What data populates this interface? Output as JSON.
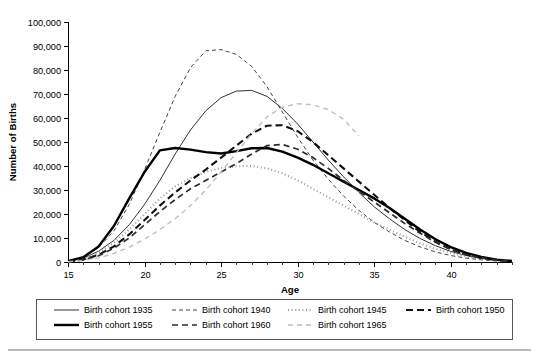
{
  "chart_data": {
    "type": "line",
    "title": "",
    "xlabel": "Age",
    "ylabel": "Number of Births",
    "xlim": [
      15,
      44
    ],
    "ylim": [
      0,
      100000
    ],
    "ytick_labels": [
      "0",
      "10,000",
      "20,000",
      "30,000",
      "40,000",
      "50,000",
      "60,000",
      "70,000",
      "80,000",
      "90,000",
      "100,000"
    ],
    "ytick_values": [
      0,
      10000,
      20000,
      30000,
      40000,
      50000,
      60000,
      70000,
      80000,
      90000,
      100000
    ],
    "xtick_labels": [
      "15",
      "20",
      "25",
      "30",
      "35",
      "40"
    ],
    "xtick_values": [
      15,
      20,
      25,
      30,
      35,
      40
    ],
    "x_minor_step": 1,
    "grid": false,
    "legend_position": "below-plot",
    "x": [
      15,
      16,
      17,
      18,
      19,
      20,
      21,
      22,
      23,
      24,
      25,
      26,
      27,
      28,
      29,
      30,
      31,
      32,
      33,
      34,
      35,
      36,
      37,
      38,
      39,
      40,
      41,
      42,
      43,
      44
    ],
    "series": [
      {
        "name": "Birth cohort 1935",
        "style": "solid-thin",
        "color": "#1a1a1a",
        "width": 0.9,
        "dash": "none",
        "values": [
          300,
          1600,
          4500,
          9000,
          15500,
          24000,
          34000,
          45000,
          55000,
          63000,
          68500,
          71200,
          71500,
          69000,
          64000,
          57500,
          50000,
          42500,
          35500,
          29000,
          23000,
          18000,
          13500,
          9800,
          6800,
          4400,
          2700,
          1500,
          800,
          350
        ]
      },
      {
        "name": "Birth cohort 1940",
        "style": "dashed-fine",
        "color": "#444444",
        "width": 1.0,
        "dash": "4,3",
        "values": [
          400,
          2000,
          6000,
          13000,
          24000,
          38500,
          54000,
          69000,
          81000,
          88000,
          88500,
          86500,
          81500,
          73000,
          62500,
          52000,
          42500,
          34500,
          27500,
          21500,
          16500,
          12500,
          9000,
          6300,
          4200,
          2700,
          1600,
          900,
          450,
          200
        ]
      },
      {
        "name": "Birth cohort 1945",
        "style": "dotted",
        "color": "#9a9a9a",
        "width": 2.0,
        "dash": "1,2.6",
        "values": [
          250,
          1300,
          3800,
          8000,
          13500,
          20000,
          26500,
          31500,
          35000,
          37500,
          39200,
          39900,
          40000,
          39000,
          37000,
          34000,
          30500,
          27000,
          23500,
          20000,
          16500,
          13500,
          10500,
          7800,
          5500,
          3700,
          2300,
          1300,
          650,
          280
        ]
      },
      {
        "name": "Birth cohort 1950",
        "style": "dashed-bold",
        "color": "#111111",
        "width": 2.1,
        "dash": "7,4",
        "values": [
          200,
          1000,
          3000,
          6500,
          11500,
          17500,
          23500,
          29000,
          34000,
          38500,
          43500,
          48500,
          53500,
          56800,
          57000,
          54500,
          50000,
          44500,
          39000,
          33500,
          28000,
          22500,
          17500,
          12500,
          8500,
          5300,
          3100,
          1700,
          850,
          350
        ]
      },
      {
        "name": "Birth cohort 1955",
        "style": "solid-bold",
        "color": "#000000",
        "width": 2.4,
        "dash": "none",
        "values": [
          350,
          2000,
          6500,
          15000,
          26500,
          37500,
          46500,
          47500,
          46800,
          45800,
          45200,
          46200,
          47400,
          47500,
          46000,
          43500,
          40500,
          37000,
          33500,
          30000,
          26500,
          22500,
          18000,
          13500,
          9500,
          6200,
          3800,
          2100,
          1000,
          400
        ]
      },
      {
        "name": "Birth cohort 1960",
        "style": "dashed-medium",
        "color": "#2c2c2c",
        "width": 1.7,
        "dash": "6,4",
        "values": [
          180,
          900,
          2600,
          5800,
          10000,
          15500,
          21000,
          26000,
          30500,
          34000,
          37500,
          41000,
          45000,
          48500,
          49000,
          47000,
          43500,
          39000,
          34000,
          29500,
          25000,
          20500,
          16000,
          12000,
          8200,
          5200,
          3100,
          1700,
          800,
          330
        ]
      },
      {
        "name": "Birth cohort 1965",
        "style": "dashed-light",
        "color": "#c0c0c0",
        "width": 1.4,
        "dash": "5,4",
        "values": [
          120,
          600,
          1700,
          3600,
          6200,
          9500,
          13500,
          18000,
          23500,
          30000,
          37500,
          45500,
          53500,
          60500,
          64500,
          66000,
          65500,
          63500,
          59500,
          52500,
          null,
          null,
          null,
          null,
          null,
          null,
          null,
          null,
          null,
          null
        ]
      }
    ]
  },
  "legend": {
    "entries": [
      {
        "label": "Birth cohort 1935"
      },
      {
        "label": "Birth cohort 1940"
      },
      {
        "label": "Birth cohort 1945"
      },
      {
        "label": "Birth cohort 1950"
      },
      {
        "label": "Birth cohort 1955"
      },
      {
        "label": "Birth cohort 1960"
      },
      {
        "label": "Birth cohort 1965"
      }
    ]
  }
}
